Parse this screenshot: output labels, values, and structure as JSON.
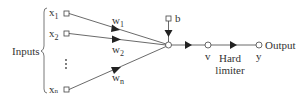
{
  "diagram": {
    "type": "perceptron",
    "group_label": "Inputs",
    "inputs": [
      {
        "label": "x",
        "sub": "1",
        "weight_label": "w",
        "weight_sub": "1"
      },
      {
        "label": "x",
        "sub": "2",
        "weight_label": "w",
        "weight_sub": "2"
      },
      {
        "label": "x",
        "sub": "n",
        "weight_label": "w",
        "weight_sub": "n"
      }
    ],
    "ellipsis": "⋮",
    "bias_label": "b",
    "induced_field_label": "v",
    "activation_label_line1": "Hard",
    "activation_label_line2": "limiter",
    "output_label": "Output",
    "output_symbol": "y",
    "colors": {
      "stroke": "#333333",
      "background": "#ffffff"
    }
  }
}
